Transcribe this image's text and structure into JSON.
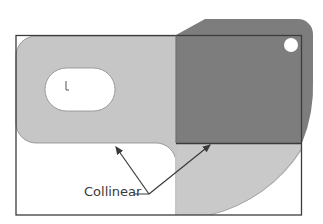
{
  "diagram": {
    "annotation": {
      "label": "Collinear"
    },
    "colors": {
      "background": "#ffffff",
      "light_part": "#c6c6c6",
      "dark_part": "#7d7d7d",
      "outline": "#3c3c3c",
      "leader": "#3a3a3a"
    },
    "elements": [
      "bounding-rectangle",
      "light-gray-part-with-slot",
      "dark-gray-part-with-hole",
      "arc-region-below-dark-part",
      "two-leader-arrows"
    ]
  }
}
